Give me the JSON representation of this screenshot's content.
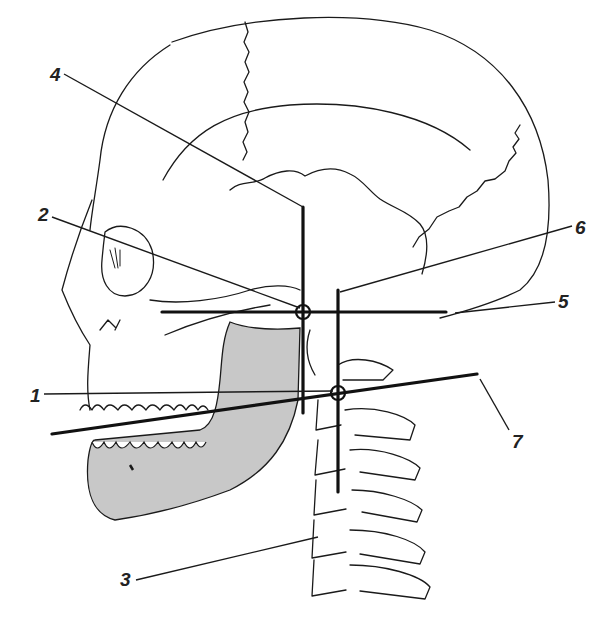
{
  "figure": {
    "colors": {
      "line": "#1a1a1a",
      "mandible_fill": "#c8c8c8",
      "background": "#ffffff"
    }
  },
  "labels": [
    {
      "id": "1",
      "text": "1",
      "x": 30,
      "y": 386
    },
    {
      "id": "2",
      "text": "2",
      "x": 38,
      "y": 205
    },
    {
      "id": "3",
      "text": "3",
      "x": 120,
      "y": 570
    },
    {
      "id": "4",
      "text": "4",
      "x": 50,
      "y": 65
    },
    {
      "id": "5",
      "text": "5",
      "x": 558,
      "y": 292
    },
    {
      "id": "6",
      "text": "6",
      "x": 575,
      "y": 218
    },
    {
      "id": "7",
      "text": "7",
      "x": 512,
      "y": 432
    }
  ]
}
